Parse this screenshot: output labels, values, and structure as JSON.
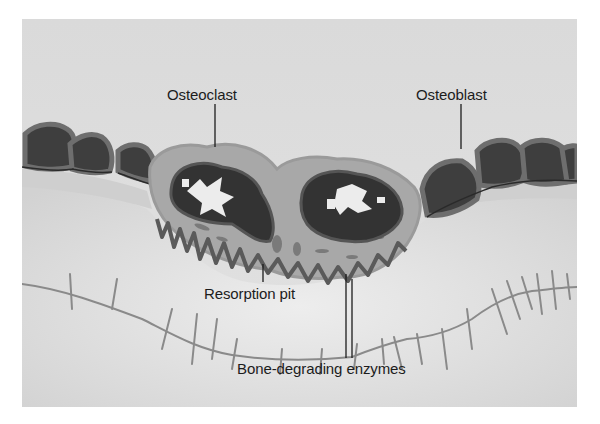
{
  "diagram": {
    "type": "biological-illustration",
    "labels": {
      "osteoclast": "Osteoclast",
      "osteoblast": "Osteoblast",
      "resorption_pit": "Resorption pit",
      "enzymes": "Bone-degrading enzymes"
    },
    "colors": {
      "background": "#dcdcdc",
      "bone": "#e6e6e6",
      "cell_cytoplasm": "#a9a9a9",
      "cell_dark": "#3a3a3a",
      "nucleus_light": "#eeeeee",
      "canal": "#8a8a8a",
      "text": "#1c1c1c"
    }
  }
}
